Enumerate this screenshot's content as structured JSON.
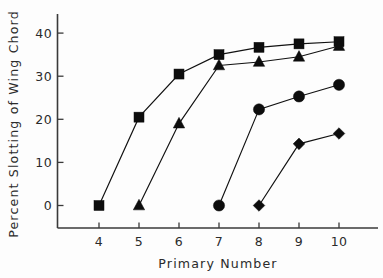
{
  "chart_data": {
    "type": "line",
    "title": "",
    "xlabel": "Primary Number",
    "ylabel": "Percent Slotting of Wing Chord",
    "x": [
      4,
      5,
      6,
      7,
      8,
      9,
      10
    ],
    "xticklabels": [
      "4",
      "5",
      "6",
      "7",
      "8",
      "9",
      "10"
    ],
    "yticks": [
      0,
      10,
      20,
      30,
      40
    ],
    "yticklabels": [
      "0",
      "10",
      "20",
      "30",
      "40"
    ],
    "xlim": [
      3.4,
      10.6
    ],
    "ylim": [
      -2,
      43
    ],
    "grid": false,
    "legend": "none",
    "series": [
      {
        "name": "square-series",
        "marker": "square",
        "x": [
          4,
          5,
          6,
          7,
          8,
          9,
          10
        ],
        "values": [
          0,
          20.5,
          30.5,
          35.0,
          36.7,
          37.5,
          38.0
        ]
      },
      {
        "name": "triangle-series",
        "marker": "triangle",
        "x": [
          5,
          6,
          7,
          8,
          9,
          10
        ],
        "values": [
          0,
          19.0,
          32.5,
          33.3,
          34.5,
          37.0
        ]
      },
      {
        "name": "circle-series",
        "marker": "circle",
        "x": [
          7,
          8,
          9,
          10
        ],
        "values": [
          0,
          22.3,
          25.3,
          28.0
        ]
      },
      {
        "name": "diamond-series",
        "marker": "diamond",
        "x": [
          8,
          9,
          10
        ],
        "values": [
          0,
          14.3,
          16.7
        ]
      }
    ]
  },
  "colors": {
    "marker": "#0d0d0d",
    "line": "#111111",
    "axis": "#3a3a3a",
    "text": "#2b2b2b",
    "background": "#fdfdfd"
  }
}
